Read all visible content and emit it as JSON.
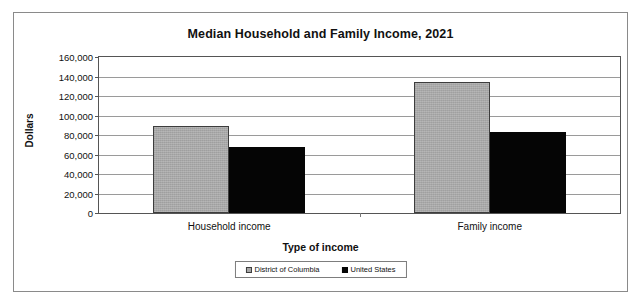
{
  "chart_data": {
    "type": "bar",
    "title": "Median Household and Family Income, 2021",
    "xlabel": "Type of income",
    "ylabel": "Dollars",
    "categories": [
      "Household income",
      "Family income"
    ],
    "series": [
      {
        "name": "District of Columbia",
        "color": "#a8a8a8",
        "values": [
          89200,
          134400
        ]
      },
      {
        "name": "United States",
        "color": "#050505",
        "values": [
          67700,
          83100
        ]
      }
    ],
    "ylim": [
      0,
      160000
    ],
    "ytick_values": [
      0,
      20000,
      40000,
      60000,
      80000,
      100000,
      120000,
      140000,
      160000
    ],
    "ytick_labels": [
      "0",
      "20,000",
      "40,000",
      "60,000",
      "80,000",
      "100,000",
      "120,000",
      "140,000",
      "160,000"
    ],
    "grid": true,
    "legend_position": "bottom"
  }
}
